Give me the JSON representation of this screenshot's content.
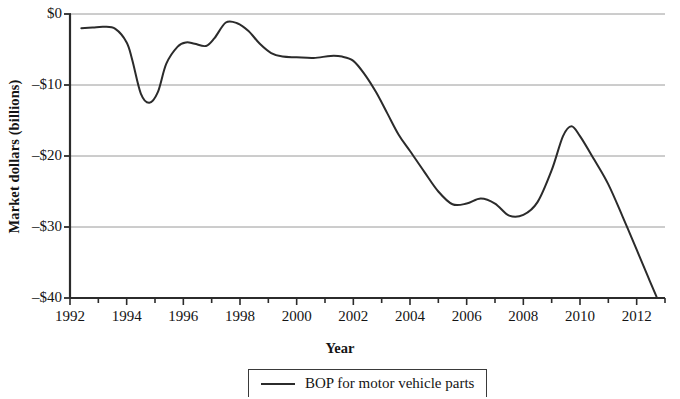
{
  "chart_data": {
    "type": "line",
    "title": "",
    "xlabel": "Year",
    "ylabel": "Market dollars (billions)",
    "xlim": [
      1992,
      2013
    ],
    "ylim": [
      -40,
      0
    ],
    "grid": true,
    "grid_axis": "y",
    "legend_position": "bottom-center",
    "x_tick_labels": [
      "1992",
      "1994",
      "1996",
      "1998",
      "2000",
      "2002",
      "2004",
      "2006",
      "2008",
      "2010",
      "2012"
    ],
    "x_tick_values": [
      1992,
      1994,
      1996,
      1998,
      2000,
      2002,
      2004,
      2006,
      2008,
      2010,
      2012
    ],
    "x_minor_tick_interval": 1,
    "y_tick_labels": [
      "$0",
      "–$10",
      "–$20",
      "–$30",
      "–$40"
    ],
    "y_tick_values": [
      0,
      -10,
      -20,
      -30,
      -40
    ],
    "series": [
      {
        "name": "BOP for motor vehicle parts",
        "color": "#2b2b2b",
        "x": [
          1992.4,
          1992.8,
          1993.2,
          1993.6,
          1994.0,
          1994.2,
          1994.5,
          1994.8,
          1995.1,
          1995.4,
          1995.8,
          1996.1,
          1996.4,
          1996.8,
          1997.1,
          1997.5,
          1997.9,
          1998.3,
          1998.7,
          1999.1,
          1999.5,
          2000.0,
          2000.6,
          2001.2,
          2001.6,
          2002.0,
          2002.4,
          2002.8,
          2003.2,
          2003.6,
          2004.0,
          2004.5,
          2005.0,
          2005.5,
          2006.0,
          2006.5,
          2007.0,
          2007.5,
          2008.0,
          2008.5,
          2009.0,
          2009.4,
          2009.7,
          2010.0,
          2010.5,
          2011.0,
          2011.5,
          2012.0,
          2012.4,
          2012.7
        ],
        "y": [
          -2.0,
          -1.9,
          -1.8,
          -2.1,
          -4.0,
          -6.5,
          -11.2,
          -12.5,
          -11.0,
          -7.0,
          -4.6,
          -4.0,
          -4.2,
          -4.5,
          -3.4,
          -1.2,
          -1.3,
          -2.4,
          -4.2,
          -5.5,
          -6.0,
          -6.1,
          -6.2,
          -5.9,
          -6.0,
          -6.6,
          -8.5,
          -11.0,
          -14.0,
          -17.0,
          -19.3,
          -22.2,
          -25.0,
          -26.8,
          -26.7,
          -26.0,
          -26.7,
          -28.4,
          -28.3,
          -26.5,
          -22.0,
          -17.2,
          -15.8,
          -17.2,
          -20.5,
          -24.0,
          -28.5,
          -33.2,
          -37.0,
          -39.8
        ]
      }
    ]
  },
  "axis": {
    "y_title": "Market dollars (billions)",
    "x_title": "Year"
  },
  "legend": {
    "entries": [
      {
        "label": "BOP for motor vehicle parts",
        "marker": "line"
      }
    ]
  }
}
